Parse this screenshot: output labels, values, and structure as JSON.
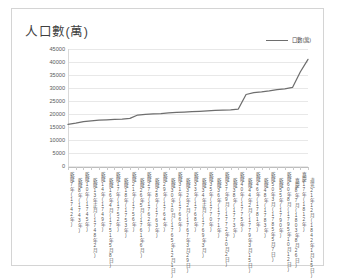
{
  "chart": {
    "title": "人口數(萬)",
    "legend": {
      "position": "top-right",
      "entries": [
        "口數(萬)"
      ]
    }
  },
  "chart_data": {
    "type": "line",
    "title": "人口數(萬)",
    "xlabel": "",
    "ylabel": "人口數(萬)",
    "ylim": [
      0,
      45000
    ],
    "ytick_labels": [
      "45000",
      "40000",
      "35000",
      "30000",
      "25000",
      "20000",
      "15000",
      "10000",
      "5000",
      "0"
    ],
    "yticks": [
      45000,
      40000,
      35000,
      30000,
      25000,
      20000,
      15000,
      10000,
      5000,
      0
    ],
    "grid": true,
    "legend": [
      "口數(萬)"
    ],
    "line_color": "#6e6e6e",
    "categories": [
      "乾隆7年(1742年)",
      "乾隆8年(1743年)",
      "乾隆10年(1745年)",
      "乾隆13年正月(1748年2月)",
      "乾隆14年(1749年)",
      "乾隆16年4月(1751年5月8日)",
      "乾隆17年(1752年)",
      "乾隆18年(1753年)",
      "乾隆21年(1756年)",
      "乾隆26年5月(1761年6月)",
      "乾隆27年(1762年)",
      "乾隆28年(1763年)",
      "乾隆29年(1764年)",
      "乾隆30年10月(1765年12月1日)",
      "乾隆31年(1766年)",
      "乾隆32年2月(1767年3月29日)",
      "乾隆33年(1768年)",
      "乾隆34年正月(1769年3月)",
      "乾隆35年(1770年)",
      "乾隆36年(1771年)",
      "乾隆37年9月(1772年10月2日)",
      "乾隆38年(1773年)",
      "乾隆40年(1775年)",
      "乾隆44年2月(1779年3月15日)",
      "乾隆46年(1781年)",
      "乾隆48年(1783年)",
      "乾隆50年3月(1785年5月7日)",
      "乾隆55年(1790年)",
      "乾隆60年8月(1795年10月12日)",
      "嘉慶8年7月(1803年8月26日)",
      "嘉慶17年(1812年)",
      "道光21年12月(1842年1月15日)"
    ],
    "series": [
      {
        "name": "口數(萬)",
        "values": [
          15980,
          16450,
          17100,
          17400,
          17600,
          17750,
          17900,
          18050,
          18300,
          19600,
          19900,
          20050,
          20180,
          20420,
          20600,
          20750,
          20880,
          21000,
          21170,
          21400,
          21500,
          21600,
          21900,
          27500,
          28200,
          28500,
          28900,
          29400,
          29700,
          30200,
          36170,
          41000
        ]
      }
    ]
  }
}
